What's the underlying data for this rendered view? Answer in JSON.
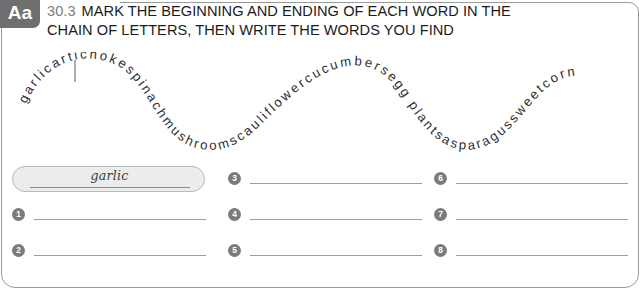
{
  "worksheet": {
    "badge": "Aa",
    "exercise_number": "30.3",
    "instruction_line_1": "MARK THE BEGINNING AND ENDING OF EACH WORD IN THE",
    "instruction_line_2": "CHAIN OF LETTERS, THEN WRITE THE WORDS YOU FIND"
  },
  "letter_chain": {
    "text": "garlicartichokespinachmushroomscauliflowercucumbersbeggplantsasparagussweetcorn",
    "letters": "garlicartichokespinachmushroomscauliflowercucumbersegg plantsasparagussweetcorn",
    "separator_after": "garlic",
    "separator_index": 6,
    "words_hidden": [
      "garlic",
      "artichoke",
      "spinach",
      "mushrooms",
      "cauliflower",
      "cucumbers",
      "eggplants",
      "asparagus",
      "sweetcorn"
    ]
  },
  "example": {
    "word": "garlic"
  },
  "answers": {
    "items": [
      {
        "number": "1",
        "value": ""
      },
      {
        "number": "2",
        "value": ""
      },
      {
        "number": "3",
        "value": ""
      },
      {
        "number": "4",
        "value": ""
      },
      {
        "number": "5",
        "value": ""
      },
      {
        "number": "6",
        "value": ""
      },
      {
        "number": "7",
        "value": ""
      },
      {
        "number": "8",
        "value": ""
      }
    ]
  },
  "colors": {
    "badge_bg": "#6f6f6f",
    "number_gray": "#7d7d7d",
    "bullet_bg": "#7b7b7b",
    "example_bg": "#ececec",
    "rule": "#9e9e9e",
    "frame": "#9a9a9a",
    "text": "#1b1b1b"
  }
}
